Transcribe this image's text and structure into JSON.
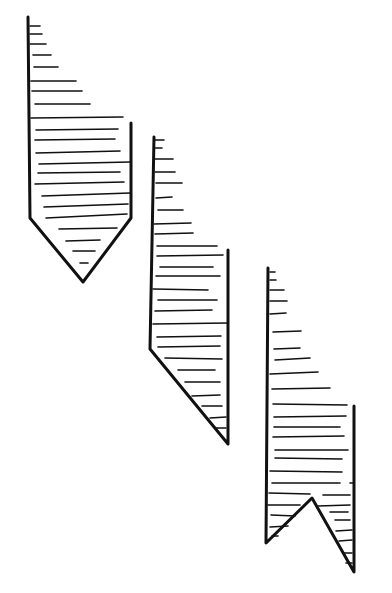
{
  "figure": {
    "stroke_color": "#111111",
    "background": "#ffffff",
    "ribbons": [
      {
        "name": "pointed-end",
        "outline": [
          [
            28,
            17
          ],
          [
            30,
            218
          ],
          [
            83,
            282
          ],
          [
            131,
            218
          ],
          [
            131,
            123
          ]
        ],
        "hatch_lines": [
          [
            30,
            26,
            40,
            26
          ],
          [
            30,
            34,
            42,
            34
          ],
          [
            30,
            44,
            46,
            44
          ],
          [
            33,
            55,
            51,
            55
          ],
          [
            34,
            67,
            58,
            67
          ],
          [
            31,
            81,
            76,
            81
          ],
          [
            32,
            91,
            82,
            91
          ],
          [
            35,
            104,
            90,
            104
          ],
          [
            31,
            118,
            123,
            117
          ],
          [
            36,
            130,
            118,
            129
          ],
          [
            35,
            140,
            115,
            139
          ],
          [
            36,
            153,
            120,
            151
          ],
          [
            39,
            164,
            130,
            162
          ],
          [
            38,
            173,
            120,
            172
          ],
          [
            35,
            184,
            124,
            182
          ],
          [
            42,
            196,
            130,
            193
          ],
          [
            44,
            207,
            128,
            204
          ],
          [
            46,
            218,
            127,
            214
          ],
          [
            59,
            229,
            117,
            228
          ],
          [
            66,
            241,
            100,
            240
          ],
          [
            73,
            251,
            95,
            251
          ],
          [
            80,
            263,
            88,
            263
          ]
        ]
      },
      {
        "name": "diagonal-end",
        "outline": [
          [
            154,
            137
          ],
          [
            150,
            349
          ],
          [
            228,
            444
          ],
          [
            228,
            250
          ]
        ],
        "hatch_lines": [
          [
            155,
            140,
            164,
            140
          ],
          [
            155,
            148,
            162,
            148
          ],
          [
            155,
            159,
            173,
            159
          ],
          [
            155,
            172,
            175,
            172
          ],
          [
            156,
            183,
            182,
            183
          ],
          [
            156,
            198,
            172,
            197
          ],
          [
            158,
            210,
            183,
            210
          ],
          [
            154,
            224,
            191,
            223
          ],
          [
            155,
            234,
            193,
            233
          ],
          [
            157,
            246,
            217,
            246
          ],
          [
            157,
            256,
            223,
            255
          ],
          [
            160,
            267,
            213,
            267
          ],
          [
            156,
            276,
            220,
            276
          ],
          [
            153,
            289,
            208,
            290
          ],
          [
            158,
            300,
            217,
            300
          ],
          [
            155,
            311,
            212,
            310
          ],
          [
            153,
            324,
            228,
            323
          ],
          [
            157,
            337,
            221,
            336
          ],
          [
            158,
            347,
            220,
            346
          ],
          [
            165,
            358,
            222,
            359
          ],
          [
            178,
            370,
            215,
            370
          ],
          [
            185,
            382,
            220,
            382
          ],
          [
            192,
            396,
            220,
            395
          ],
          [
            202,
            406,
            222,
            406
          ],
          [
            210,
            418,
            226,
            417
          ],
          [
            215,
            428,
            226,
            428
          ]
        ]
      },
      {
        "name": "notched-end",
        "outline": [
          [
            268,
            268
          ],
          [
            266,
            543
          ],
          [
            312,
            498
          ],
          [
            354,
            572
          ],
          [
            354,
            406
          ]
        ],
        "hatch_lines": [
          [
            270,
            272,
            275,
            272
          ],
          [
            270,
            280,
            276,
            280
          ],
          [
            270,
            290,
            284,
            290
          ],
          [
            270,
            301,
            287,
            301
          ],
          [
            270,
            314,
            286,
            313
          ],
          [
            273,
            332,
            301,
            331
          ],
          [
            274,
            349,
            300,
            348
          ],
          [
            275,
            360,
            310,
            358
          ],
          [
            270,
            374,
            318,
            372
          ],
          [
            272,
            389,
            330,
            388
          ],
          [
            273,
            404,
            347,
            405
          ],
          [
            274,
            417,
            346,
            416
          ],
          [
            274,
            427,
            340,
            427
          ],
          [
            273,
            437,
            344,
            436
          ],
          [
            275,
            450,
            348,
            450
          ],
          [
            275,
            458,
            342,
            459
          ],
          [
            270,
            471,
            342,
            472
          ],
          [
            272,
            483,
            340,
            483
          ],
          [
            350,
            483,
            353,
            483
          ],
          [
            269,
            493,
            310,
            494
          ],
          [
            323,
            495,
            350,
            495
          ],
          [
            268,
            505,
            300,
            505
          ],
          [
            318,
            506,
            350,
            505
          ],
          [
            271,
            515,
            295,
            516
          ],
          [
            330,
            512,
            348,
            512
          ],
          [
            270,
            527,
            288,
            526
          ],
          [
            335,
            520,
            350,
            520
          ],
          [
            272,
            536,
            278,
            536
          ],
          [
            336,
            531,
            352,
            530
          ],
          [
            339,
            541,
            352,
            540
          ],
          [
            343,
            553,
            352,
            553
          ],
          [
            346,
            563,
            352,
            563
          ]
        ]
      }
    ]
  }
}
